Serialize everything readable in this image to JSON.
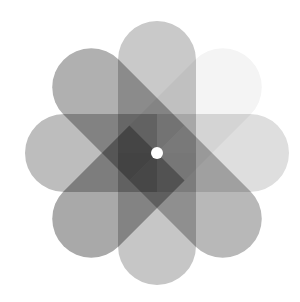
{
  "image": {
    "label": "Grayscale pinwheel flower icon",
    "center": [
      157,
      153
    ],
    "petal_width": 78,
    "petal_length": 132,
    "petals": [
      {
        "name": "top",
        "angle": 0,
        "color": "#c9c9c9"
      },
      {
        "name": "upper-right",
        "angle": 45,
        "color": "#f4f4f4"
      },
      {
        "name": "right",
        "angle": 90,
        "color": "#dedede"
      },
      {
        "name": "lower-right",
        "angle": 135,
        "color": "#b8b8b8"
      },
      {
        "name": "bottom",
        "angle": 180,
        "color": "#c6c6c6"
      },
      {
        "name": "lower-left",
        "angle": 225,
        "color": "#a9a9a9"
      },
      {
        "name": "left",
        "angle": 270,
        "color": "#bdbdbd"
      },
      {
        "name": "upper-left",
        "angle": 315,
        "color": "#b0b0b0"
      }
    ],
    "center_hole_color": "#ffffff"
  }
}
